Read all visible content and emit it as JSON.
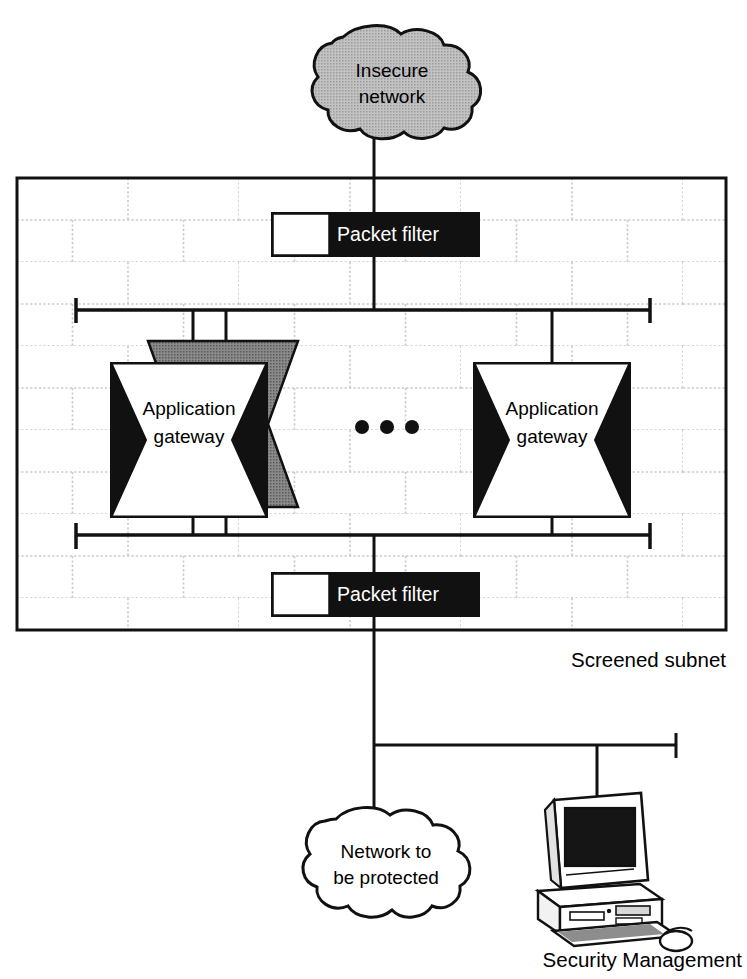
{
  "diagram": {
    "colors": {
      "ink": "#111111",
      "brick_line": "#c9c9c9",
      "cloud_gray": "#b9b9b9",
      "shadow_gray": "#7d7d7d",
      "black_fill": "#111111",
      "white_fill": "#ffffff"
    },
    "clouds": [
      {
        "name": "insecure-network",
        "lines": [
          "Insecure",
          "network"
        ],
        "fill": "gray"
      },
      {
        "name": "protected-network",
        "lines": [
          "Network to",
          "be protected"
        ],
        "fill": "white"
      }
    ],
    "packet_filters": [
      {
        "name": "packet-filter-outer",
        "label": "Packet filter"
      },
      {
        "name": "packet-filter-inner",
        "label": "Packet filter"
      }
    ],
    "gateways": [
      {
        "name": "application-gateway-left",
        "lines": [
          "Application",
          "gateway"
        ],
        "has_shadow": true
      },
      {
        "name": "application-gateway-right",
        "lines": [
          "Application",
          "gateway"
        ],
        "has_shadow": false
      }
    ],
    "ellipsis": {
      "name": "gateway-ellipsis",
      "dots": 3,
      "meaning": "more application gateways"
    },
    "wall": {
      "name": "screened-subnet-wall",
      "label": "Screened subnet"
    },
    "workstation": {
      "name": "security-management-workstation",
      "label": "Security Management"
    }
  }
}
